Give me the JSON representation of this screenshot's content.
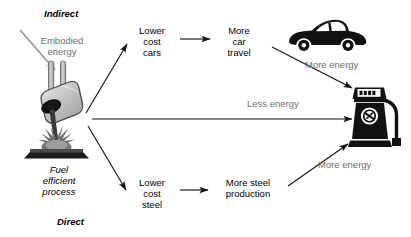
{
  "diagram": {
    "sections": {
      "indirect_label": "Indirect",
      "direct_label": "Direct"
    },
    "nodes": {
      "embodied_energy": "Embodied\nenergy",
      "process": "Fuel\nefficient\nprocess",
      "lower_cost_cars": "Lower\ncost\ncars",
      "more_car_travel": "More\ncar\ntravel",
      "lower_cost_steel": "Lower\ncost\nsteel",
      "more_steel_production": "More steel\nproduction"
    },
    "edge_labels": {
      "more_energy_top": "More energy",
      "less_energy": "Less energy",
      "more_energy_bottom": "More energy"
    },
    "icons": {
      "crucible": "crucible-pouring-icon",
      "car": "car-icon",
      "fuel_pump": "fuel-pump-icon"
    },
    "colors": {
      "text": "#000000",
      "muted_text": "#6e6e6e",
      "arrow": "#1a1a1a",
      "muted_arrow": "#8a8a8a",
      "crucible_light": "#d2d2d2",
      "crucible_mid": "#a8a8a8",
      "crucible_dark": "#6f6f6f",
      "ink": "#101010",
      "background": "#ffffff"
    }
  }
}
